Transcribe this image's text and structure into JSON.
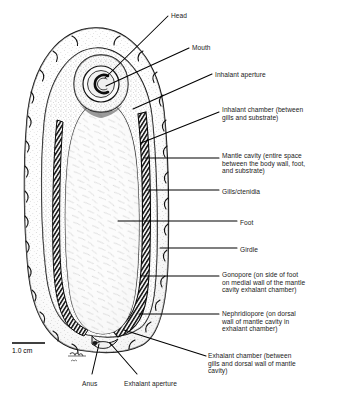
{
  "figure": {
    "background_color": "#ffffff",
    "ink_color": "#000000",
    "scale_bar": {
      "label": "1.0 cm",
      "name": "scale-bar"
    },
    "signature": "artist signature"
  },
  "labels": [
    {
      "id": "head",
      "text": "Head",
      "x": 171,
      "y": 12,
      "align": "left"
    },
    {
      "id": "mouth",
      "text": "Mouth",
      "x": 192,
      "y": 44,
      "align": "left"
    },
    {
      "id": "inhalant-aperture",
      "text": "Inhalant aperture",
      "x": 215,
      "y": 71,
      "align": "left"
    },
    {
      "id": "inhalant-chamber",
      "text": "Inhalant chamber (between\ngills and substrate)",
      "x": 222,
      "y": 106,
      "align": "left"
    },
    {
      "id": "mantle-cavity",
      "text": "Mantle cavity (entire space\nbetween the body wall, foot,\nand substrate)",
      "x": 222,
      "y": 152,
      "align": "left"
    },
    {
      "id": "gills-ctenidia",
      "text": "Gills/ctenidia",
      "x": 222,
      "y": 188,
      "align": "left"
    },
    {
      "id": "foot",
      "text": "Foot",
      "x": 240,
      "y": 219,
      "align": "left"
    },
    {
      "id": "girdle",
      "text": "Girdle",
      "x": 240,
      "y": 246,
      "align": "left"
    },
    {
      "id": "gonopore",
      "text": "Gonopore (on side of foot\non medial wall of the mantle\ncavity exhalant chamber)",
      "x": 222,
      "y": 271,
      "align": "left"
    },
    {
      "id": "nephridiopore",
      "text": "Nephridiopore (on dorsal\nwall of mantle cavity in\nexhalant chamber)",
      "x": 222,
      "y": 310,
      "align": "left"
    },
    {
      "id": "exhalant-chamber",
      "text": "Exhalant chamber (between\ngills and dorsal wall of mantle\ncavity)",
      "x": 208,
      "y": 352,
      "align": "left"
    },
    {
      "id": "anus",
      "text": "Anus",
      "x": 82,
      "y": 380,
      "align": "left"
    },
    {
      "id": "exhalant-aperture",
      "text": "Exhalant aperture",
      "x": 124,
      "y": 380,
      "align": "left"
    }
  ],
  "anatomy_parts": [
    "girdle",
    "foot",
    "head",
    "mouth",
    "gills-ctenidia",
    "mantle-cavity",
    "inhalant-aperture",
    "inhalant-chamber",
    "exhalant-chamber",
    "exhalant-aperture",
    "gonopore",
    "nephridiopore",
    "anus"
  ]
}
